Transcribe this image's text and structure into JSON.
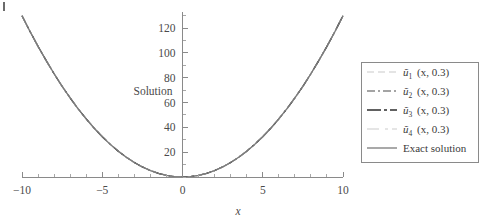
{
  "figure": {
    "type": "line-plot",
    "background": "#ffffff",
    "axis_color": "#8a8a8a",
    "text_color": "#3a3a3a"
  },
  "chart_data": {
    "type": "line",
    "title": "",
    "subtitle": "",
    "xlabel": "x",
    "ylabel": "Solution",
    "xlim": [
      -10,
      10
    ],
    "ylim": [
      0,
      133
    ],
    "grid": false,
    "legend_position": "right-outside",
    "x_ticks": [
      -10,
      -5,
      0,
      5,
      10
    ],
    "x_tick_labels": [
      "−10",
      "−5",
      "0",
      "5",
      "10"
    ],
    "x_minor_tick_step": 1,
    "y_ticks": [
      20,
      40,
      60,
      80,
      100,
      120
    ],
    "y_tick_labels": [
      "20",
      "40",
      "60",
      "80",
      "100",
      "120"
    ],
    "y_minor_tick_step": 10,
    "x": [
      -10,
      -9.5,
      -9,
      -8.5,
      -8,
      -7.5,
      -7,
      -6.5,
      -6,
      -5.5,
      -5,
      -4.5,
      -4,
      -3.5,
      -3,
      -2.5,
      -2,
      -1.5,
      -1,
      -0.5,
      0,
      0.5,
      1,
      1.5,
      2,
      2.5,
      3,
      3.5,
      4,
      4.5,
      5,
      5.5,
      6,
      6.5,
      7,
      7.5,
      8,
      8.5,
      9,
      9.5,
      10
    ],
    "series": [
      {
        "name": "u1",
        "label_base": "ũ",
        "label_sub": "1",
        "label_tail": "(x, 0.3)",
        "style": "dashed",
        "color": "#c9c9c9",
        "width": 1.2,
        "dash": "7,4",
        "values": [
          130,
          117.3,
          105.3,
          94,
          83.2,
          73.1,
          63.7,
          54.9,
          46.8,
          39.3,
          32.5,
          26.3,
          20.8,
          15.9,
          11.7,
          8.1,
          5.2,
          2.9,
          1.3,
          0.3,
          0,
          0.3,
          1.3,
          2.9,
          5.2,
          8.1,
          11.7,
          15.9,
          20.8,
          26.3,
          32.5,
          39.3,
          46.8,
          54.9,
          63.7,
          73.1,
          83.2,
          94,
          105.3,
          117.3,
          130
        ]
      },
      {
        "name": "u2",
        "label_base": "ũ",
        "label_sub": "2",
        "label_tail": "(x, 0.3)",
        "style": "dashdot",
        "color": "#4a4a4a",
        "width": 1.1,
        "dash": "8,3,2,3",
        "values": [
          130,
          117.3,
          105.3,
          94,
          83.2,
          73.1,
          63.7,
          54.9,
          46.8,
          39.3,
          32.5,
          26.3,
          20.8,
          15.9,
          11.7,
          8.1,
          5.2,
          2.9,
          1.3,
          0.3,
          0,
          0.3,
          1.3,
          2.9,
          5.2,
          8.1,
          11.7,
          15.9,
          20.8,
          26.3,
          32.5,
          39.3,
          46.8,
          54.9,
          63.7,
          73.1,
          83.2,
          94,
          105.3,
          117.3,
          130
        ]
      },
      {
        "name": "u3",
        "label_base": "ũ",
        "label_sub": "3",
        "label_tail": "(x, 0.3)",
        "style": "longdash-dot",
        "color": "#2e2e2e",
        "width": 1.3,
        "dash": "14,3,3,3",
        "values": [
          130,
          117.3,
          105.3,
          94,
          83.2,
          73.1,
          63.7,
          54.9,
          46.8,
          39.3,
          32.5,
          26.3,
          20.8,
          15.9,
          11.7,
          8.1,
          5.2,
          2.9,
          1.3,
          0.3,
          0,
          0.3,
          1.3,
          2.9,
          5.2,
          8.1,
          11.7,
          15.9,
          20.8,
          26.3,
          32.5,
          39.3,
          46.8,
          54.9,
          63.7,
          73.1,
          83.2,
          94,
          105.3,
          117.3,
          130
        ]
      },
      {
        "name": "u4",
        "label_base": "ũ",
        "label_sub": "4",
        "label_tail": "(x, 0.3)",
        "style": "longdash-dash",
        "color": "#cccccc",
        "width": 1.2,
        "dash": "12,6,3,4",
        "values": [
          130,
          117.3,
          105.3,
          94,
          83.2,
          73.1,
          63.7,
          54.9,
          46.8,
          39.3,
          32.5,
          26.3,
          20.8,
          15.9,
          11.7,
          8.1,
          5.2,
          2.9,
          1.3,
          0.3,
          0,
          0.3,
          1.3,
          2.9,
          5.2,
          8.1,
          11.7,
          15.9,
          20.8,
          26.3,
          32.5,
          39.3,
          46.8,
          54.9,
          63.7,
          73.1,
          83.2,
          94,
          105.3,
          117.3,
          130
        ]
      },
      {
        "name": "exact",
        "label_full": "Exact solution",
        "style": "solid",
        "color": "#7a7a7a",
        "width": 1.3,
        "dash": "",
        "values": [
          130,
          117.3,
          105.3,
          94,
          83.2,
          73.1,
          63.7,
          54.9,
          46.8,
          39.3,
          32.5,
          26.3,
          20.8,
          15.9,
          11.7,
          8.1,
          5.2,
          2.9,
          1.3,
          0.3,
          0,
          0.3,
          1.3,
          2.9,
          5.2,
          8.1,
          11.7,
          15.9,
          20.8,
          26.3,
          32.5,
          39.3,
          46.8,
          54.9,
          63.7,
          73.1,
          83.2,
          94,
          105.3,
          117.3,
          130
        ]
      }
    ],
    "annotations": []
  },
  "legend": {
    "entries": [
      {
        "text": "(x, 0.3)",
        "sub": "1",
        "base": "ũ"
      },
      {
        "text": "(x, 0.3)",
        "sub": "2",
        "base": "ũ"
      },
      {
        "text": "(x, 0.3)",
        "sub": "3",
        "base": "ũ"
      },
      {
        "text": "(x, 0.3)",
        "sub": "4",
        "base": "ũ"
      },
      {
        "text": "Exact solution",
        "sub": "",
        "base": ""
      }
    ]
  }
}
